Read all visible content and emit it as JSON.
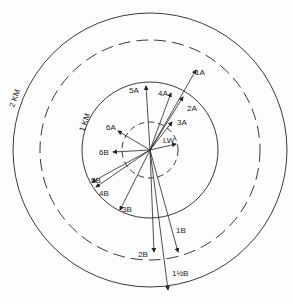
{
  "diagram": {
    "type": "polar vector diagram (hand drawn)",
    "center": [
      150,
      150
    ],
    "rings": [
      {
        "name": "ring-lw",
        "r": 28,
        "style": "dashed"
      },
      {
        "name": "ring-1km",
        "r": 68,
        "style": "solid",
        "label": "1 KM"
      },
      {
        "name": "ring-mid",
        "r": 110,
        "style": "dashed"
      },
      {
        "name": "ring-2km",
        "r": 135,
        "style": "solid",
        "label": "2 KM"
      }
    ],
    "vectors": [
      {
        "label": "1A",
        "angle": 30,
        "length": 92
      },
      {
        "label": "2A",
        "angle": 25,
        "length": 55
      },
      {
        "label": "3A",
        "angle": 35,
        "length": 35
      },
      {
        "label": "4A",
        "angle": 15,
        "length": 60
      },
      {
        "label": "5A",
        "angle": 0,
        "length": 65
      },
      {
        "label": "6A",
        "angle": -60,
        "length": 50
      },
      {
        "label": "LW",
        "angle": 75,
        "length": 22
      },
      {
        "label": "1B",
        "angle": 165,
        "length": 120
      },
      {
        "label": "1½B",
        "angle": 173,
        "length": 150
      },
      {
        "label": "2B",
        "angle": 182,
        "length": 110
      },
      {
        "label": "3B",
        "angle": 210,
        "length": 85
      },
      {
        "label": "4B",
        "angle": 238,
        "length": 100
      },
      {
        "label": "5B",
        "angle": 241,
        "length": 100
      },
      {
        "label": "6B",
        "angle": -90,
        "length": 40
      }
    ],
    "labels": {
      "ring_1km": "1 KM",
      "ring_2km": "2 KM",
      "v1A": "1A",
      "v2A": "2A",
      "v3A": "3A",
      "v4A": "4A",
      "v5A": "5A",
      "v6A": "6A",
      "vLW": "LW",
      "v1B": "1B",
      "v15B": "1½B",
      "v2B": "2B",
      "v3B": "3B",
      "v4B": "4B",
      "v5B": "5B",
      "v6B": "6B"
    },
    "ink_color": "#222222"
  }
}
